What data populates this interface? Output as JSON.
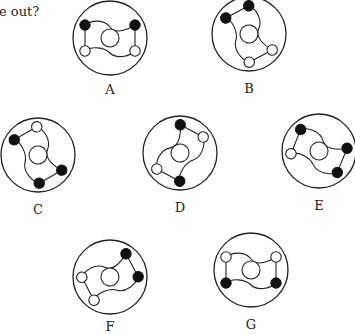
{
  "question": {
    "text": "e out?"
  },
  "figures": [
    {
      "label": "A",
      "dots": [
        "filled",
        "filled",
        "hollow",
        "hollow"
      ]
    },
    {
      "label": "B",
      "dots": [
        "filled",
        "hollow",
        "hollow",
        "filled"
      ]
    },
    {
      "label": "C",
      "dots": [
        "hollow",
        "filled",
        "filled",
        "filled"
      ]
    },
    {
      "label": "D",
      "dots": [
        "hollow",
        "filled",
        "hollow",
        "filled"
      ]
    },
    {
      "label": "E",
      "dots": [
        "filled",
        "filled",
        "filled",
        "hollow"
      ]
    },
    {
      "label": "F",
      "dots": [
        "hollow",
        "filled",
        "filled",
        "hollow"
      ]
    },
    {
      "label": "G",
      "dots": [
        "hollow",
        "hollow",
        "filled",
        "filled"
      ]
    }
  ],
  "colors": {
    "ink": "#222222",
    "filled": "#111111",
    "background": "#ffffff"
  }
}
